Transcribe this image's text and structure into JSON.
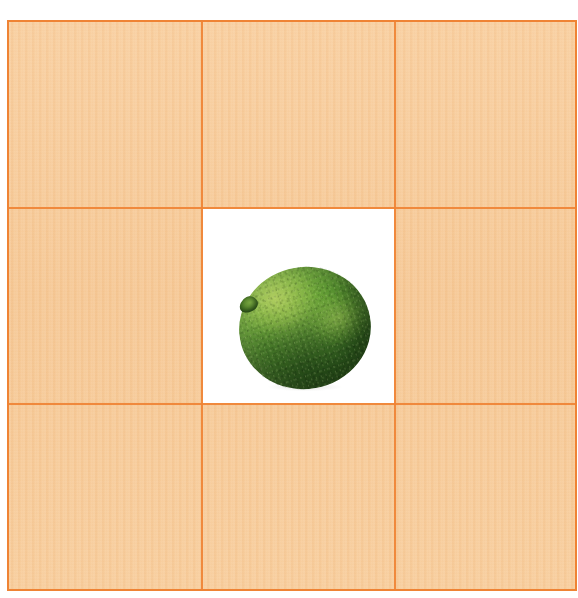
{
  "page": {
    "canvas_width": 578,
    "canvas_height": 598,
    "background_color": "#ffffff"
  },
  "grid": {
    "name": "three-by-three-grid",
    "rows": 3,
    "columns": 3,
    "border_color": "#ef8334",
    "line_color": "#ef8334",
    "cell_background_color": "#f7cb99",
    "center_cell_background_color": "#ffffff",
    "cells": [
      {
        "id": "cell-top-left",
        "row": 1,
        "column": 1,
        "fill": "#f7cb99",
        "content": ""
      },
      {
        "id": "cell-top-center",
        "row": 1,
        "column": 2,
        "fill": "#f7cb99",
        "content": ""
      },
      {
        "id": "cell-top-right",
        "row": 1,
        "column": 3,
        "fill": "#f7cb99",
        "content": ""
      },
      {
        "id": "cell-middle-left",
        "row": 2,
        "column": 1,
        "fill": "#f7cb99",
        "content": ""
      },
      {
        "id": "cell-middle-center",
        "row": 2,
        "column": 2,
        "fill": "#ffffff",
        "content": "lime-photo"
      },
      {
        "id": "cell-middle-right",
        "row": 2,
        "column": 3,
        "fill": "#f7cb99",
        "content": ""
      },
      {
        "id": "cell-bottom-left",
        "row": 3,
        "column": 1,
        "fill": "#f7cb99",
        "content": ""
      },
      {
        "id": "cell-bottom-center",
        "row": 3,
        "column": 2,
        "fill": "#f7cb99",
        "content": ""
      },
      {
        "id": "cell-bottom-right",
        "row": 3,
        "column": 3,
        "fill": "#f7cb99",
        "content": ""
      }
    ]
  },
  "subject": {
    "name": "lime",
    "label": "",
    "shape": "round",
    "highlight_color": "#9ec95c",
    "mid_color": "#5a9630",
    "shadow_color": "#24490f",
    "stem_color": "#3e6a21",
    "backdrop_color": "#ffffff"
  }
}
